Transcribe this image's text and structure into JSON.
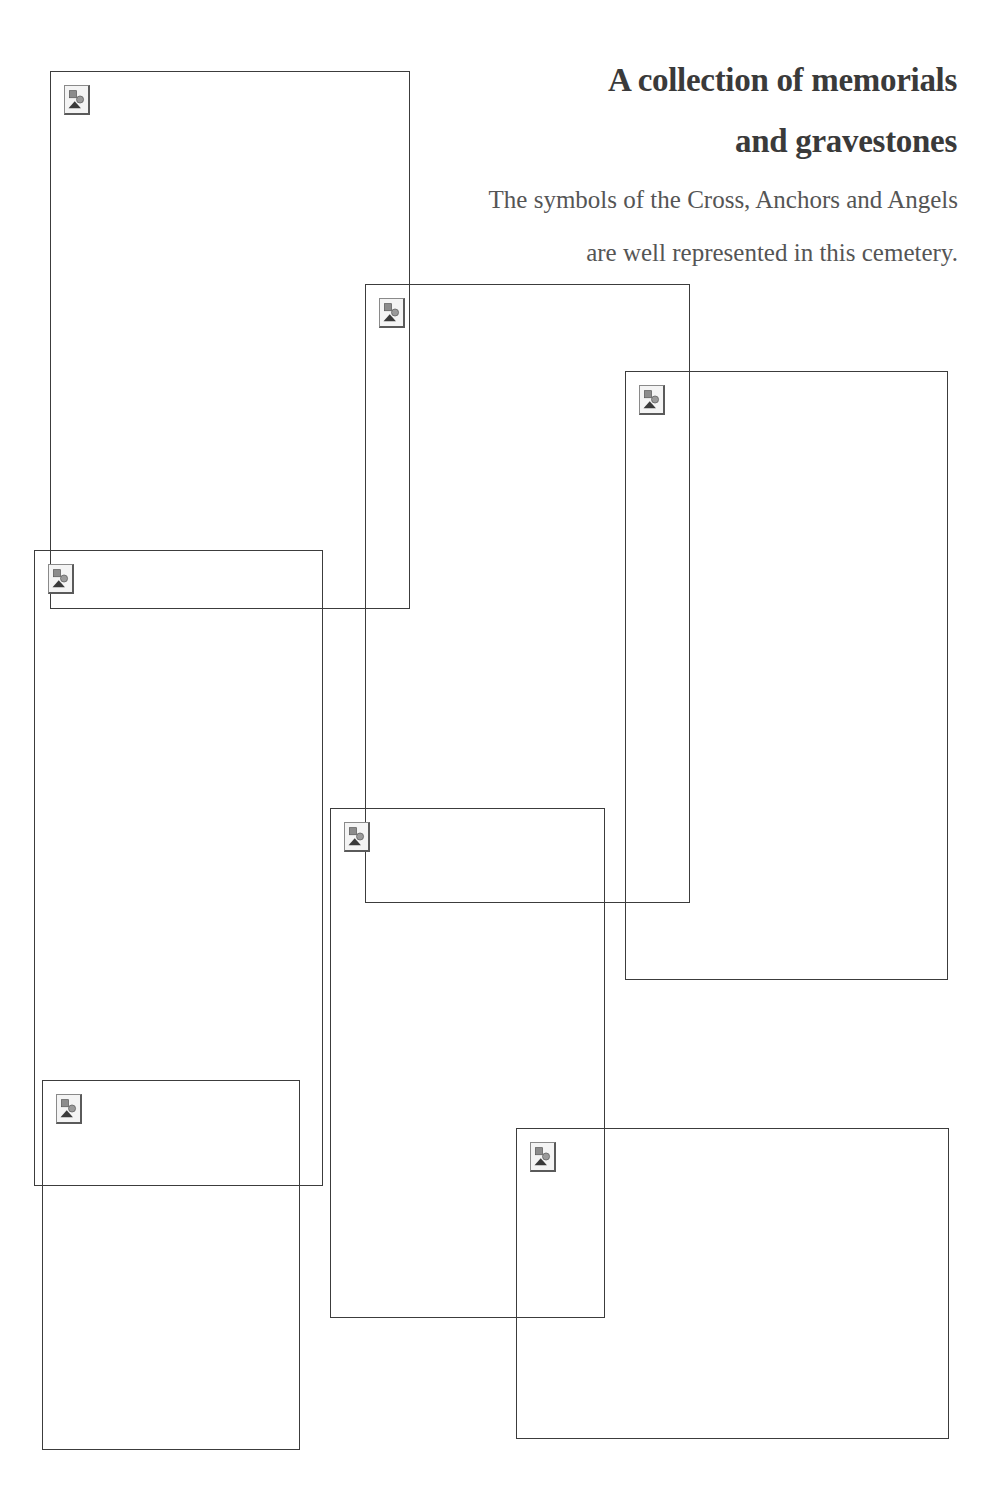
{
  "page": {
    "background": "#ffffff",
    "frame_color": "#3c3c3c"
  },
  "header": {
    "title_line1": "A collection of memorials",
    "title_line2": "and gravestones",
    "subtitle_line1": "The symbols of the Cross, Anchors and Angels",
    "subtitle_line2": "are well represented in this cemetery."
  },
  "images": [
    {
      "icon": "broken-image-icon",
      "left": 50,
      "top": 71,
      "right": 410,
      "bottom": 609
    },
    {
      "icon": "broken-image-icon",
      "left": 365,
      "top": 284,
      "right": 690,
      "bottom": 903
    },
    {
      "icon": "broken-image-icon",
      "left": 625,
      "top": 371,
      "right": 948,
      "bottom": 980
    },
    {
      "icon": "broken-image-icon",
      "left": 34,
      "top": 550,
      "right": 323,
      "bottom": 1186
    },
    {
      "icon": "broken-image-icon",
      "left": 330,
      "top": 808,
      "right": 605,
      "bottom": 1318
    },
    {
      "icon": "broken-image-icon",
      "left": 42,
      "top": 1080,
      "right": 300,
      "bottom": 1450
    },
    {
      "icon": "broken-image-icon",
      "left": 516,
      "top": 1128,
      "right": 949,
      "bottom": 1439
    }
  ]
}
